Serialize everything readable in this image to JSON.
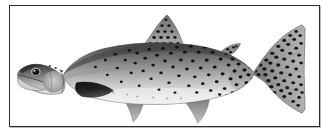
{
  "figure": {
    "view": "left lateral whole-body specimen photograph",
    "rendering": "black and white grayscale halftone",
    "caption": "",
    "frame": {
      "border_color": "#2c2c2c",
      "background_color": "#ffffff",
      "border_width_px": 1
    },
    "palette": {
      "page_background": "#ffffff",
      "plate_background": "#ffffff",
      "dorsal_dark": "#4a4a4a",
      "mid_body_gray": "#9a9a9a",
      "belly_light": "#e4e4e4",
      "spot_black": "#111111",
      "fin_gray": "#8d8d8d",
      "pectoral_dark": "#1e1e1e",
      "eye_black": "#0d0d0d"
    },
    "parts": [
      {
        "name": "head",
        "label": "Head",
        "shading": "dark gray with lighter cheek and gill plate"
      },
      {
        "name": "eye",
        "label": "Eye",
        "shading": "black pupil with pale iris ring"
      },
      {
        "name": "jaw",
        "label": "Lower jaw",
        "shading": "pale gray, mouth slightly open"
      },
      {
        "name": "operculum",
        "label": "Gill cover",
        "shading": "mottled mid gray"
      },
      {
        "name": "body",
        "label": "Body",
        "shading": "dark dorsal fading to pale belly"
      },
      {
        "name": "lateral-line",
        "label": "Lateral line",
        "shading": "faint horizontal tonal break"
      },
      {
        "name": "dorsal-fin",
        "label": "Dorsal fin",
        "shading": "gray, heavily spotted in rows"
      },
      {
        "name": "adipose-fin",
        "label": "Adipose fin",
        "shading": "small dark spotted lobe"
      },
      {
        "name": "pectoral-fin",
        "label": "Pectoral fin",
        "shading": "very dark, nearly black"
      },
      {
        "name": "pelvic-fin",
        "label": "Pelvic fin",
        "shading": "pale gray, unspotted"
      },
      {
        "name": "anal-fin",
        "label": "Anal fin",
        "shading": "pale gray, unspotted"
      },
      {
        "name": "caudal-fin",
        "label": "Caudal fin",
        "shading": "gray, densely spotted, forked"
      },
      {
        "name": "caudal-peduncle",
        "label": "Caudal peduncle",
        "shading": "densest black spotting"
      }
    ],
    "spotting": {
      "description": "small round black spots, sparse on forward flank, increasingly dense toward tail, covering dorsal fin, adipose fin and caudal fin",
      "density_front": "sparse",
      "density_rear": "dense"
    }
  }
}
